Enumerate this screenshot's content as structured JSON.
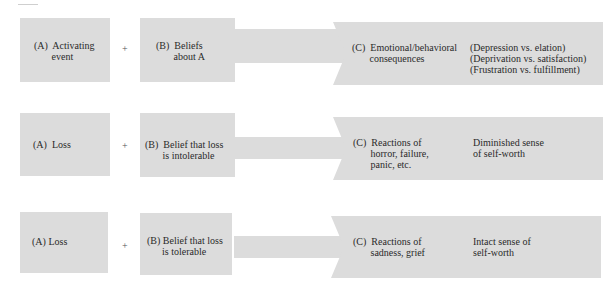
{
  "diagram": {
    "rows": [
      {
        "a": {
          "text": "(A)  Activating\n       event"
        },
        "plus": "+",
        "b": {
          "text": "(B)  Beliefs\n       about A"
        },
        "c": {
          "text": "(C)  Emotional/behavioral\n       consequences",
          "outcome": "(Depression vs. elation)\n(Deprivation vs. satisfaction)\n(Frustration vs. fulfillment)"
        }
      },
      {
        "a": {
          "text": "(A)  Loss"
        },
        "plus": "+",
        "b": {
          "text": "(B)  Belief that loss\n       is intolerable"
        },
        "c": {
          "text": "(C)  Reactions of\n       horror, failure,\n       panic, etc.",
          "outcome": "Diminished sense\nof self-worth"
        }
      },
      {
        "a": {
          "text": "(A) Loss"
        },
        "plus": "+",
        "b": {
          "text": "(B) Belief that loss\n      is tolerable"
        },
        "c": {
          "text": "(C)  Reactions of\n       sadness, grief",
          "outcome": "Intact sense of\nself-worth"
        }
      }
    ]
  }
}
